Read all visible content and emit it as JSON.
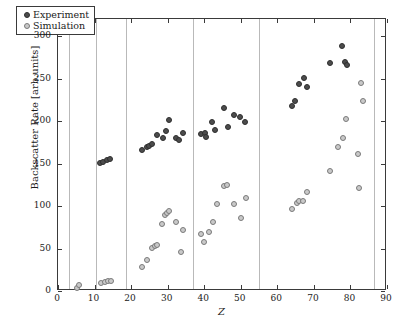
{
  "chart_data": {
    "type": "scatter",
    "title": "",
    "xlabel": "Z",
    "ylabel": "Backscatter Rate [arb.units]",
    "xlim": [
      0,
      90
    ],
    "ylim": [
      0,
      320
    ],
    "xticks": [
      0,
      10,
      20,
      30,
      40,
      50,
      60,
      70,
      80,
      90
    ],
    "yticks": [
      0,
      50,
      100,
      150,
      200,
      250,
      300
    ],
    "grid": "vertical-dotted-separators",
    "vertical_gridlines": [
      3,
      10.5,
      18.5,
      37,
      55,
      86.5
    ],
    "legend_position": "upper-left",
    "series": [
      {
        "name": "Experiment",
        "marker": "filled-circle",
        "color": "#4c4c4c",
        "points": [
          [
            11.6,
            151
          ],
          [
            12.4,
            152
          ],
          [
            13.3,
            154
          ],
          [
            14.2,
            155
          ],
          [
            23.1,
            166
          ],
          [
            24.2,
            170
          ],
          [
            25.0,
            171
          ],
          [
            25.8,
            173
          ],
          [
            27.1,
            184
          ],
          [
            28.6,
            180
          ],
          [
            29.4,
            188
          ],
          [
            30.4,
            201
          ],
          [
            32.4,
            180
          ],
          [
            33.1,
            178
          ],
          [
            34.3,
            186
          ],
          [
            39.2,
            185
          ],
          [
            40.1,
            186
          ],
          [
            40.6,
            181
          ],
          [
            42.0,
            199
          ],
          [
            42.9,
            189
          ],
          [
            45.3,
            215
          ],
          [
            46.4,
            193
          ],
          [
            48.1,
            207
          ],
          [
            49.9,
            205
          ],
          [
            51.2,
            199
          ],
          [
            64.0,
            218
          ],
          [
            64.7,
            223
          ],
          [
            65.9,
            243
          ],
          [
            67.2,
            251
          ],
          [
            68.0,
            240
          ],
          [
            74.5,
            268
          ],
          [
            77.6,
            288
          ],
          [
            78.4,
            270
          ],
          [
            79.0,
            266
          ]
        ]
      },
      {
        "name": "Simulation",
        "marker": "open-circle",
        "color": "#c9c9c9",
        "points": [
          [
            5.2,
            4
          ],
          [
            5.7,
            7
          ],
          [
            11.7,
            9
          ],
          [
            12.9,
            11
          ],
          [
            13.6,
            12
          ],
          [
            14.4,
            12
          ],
          [
            23.0,
            28
          ],
          [
            24.2,
            36
          ],
          [
            25.8,
            51
          ],
          [
            26.4,
            53
          ],
          [
            27.0,
            54
          ],
          [
            28.4,
            79
          ],
          [
            29.3,
            89
          ],
          [
            29.9,
            92
          ],
          [
            30.4,
            94
          ],
          [
            32.3,
            81
          ],
          [
            33.5,
            46
          ],
          [
            34.1,
            72
          ],
          [
            39.1,
            67
          ],
          [
            39.9,
            58
          ],
          [
            41.2,
            70
          ],
          [
            42.3,
            81
          ],
          [
            43.4,
            102
          ],
          [
            45.4,
            124
          ],
          [
            46.2,
            125
          ],
          [
            48.1,
            102
          ],
          [
            50.0,
            86
          ],
          [
            51.3,
            109
          ],
          [
            64.0,
            97
          ],
          [
            65.3,
            104
          ],
          [
            66.0,
            106
          ],
          [
            67.0,
            106
          ],
          [
            68.2,
            116
          ],
          [
            74.4,
            141
          ],
          [
            76.6,
            170
          ],
          [
            78.0,
            180
          ],
          [
            78.9,
            202
          ],
          [
            82.4,
            121
          ],
          [
            83.0,
            245
          ],
          [
            83.5,
            224
          ],
          [
            82.0,
            161
          ]
        ]
      }
    ]
  },
  "legend": {
    "entries": [
      {
        "label": "Experiment"
      },
      {
        "label": "Simulation"
      }
    ]
  },
  "axes": {
    "x_tick_labels": [
      "0",
      "10",
      "20",
      "30",
      "40",
      "50",
      "60",
      "70",
      "80",
      "90"
    ],
    "y_tick_labels": [
      "0",
      "50",
      "100",
      "150",
      "200",
      "250",
      "300"
    ],
    "x_axis_title": "Z",
    "y_axis_title": "Backscatter Rate [arb.units]"
  },
  "colors": {
    "experiment": "#4c4c4c",
    "simulation": "#c9c9c9",
    "axis": "#3a3a3a",
    "gridline": "#b9b9b9",
    "background": "#ffffff"
  }
}
